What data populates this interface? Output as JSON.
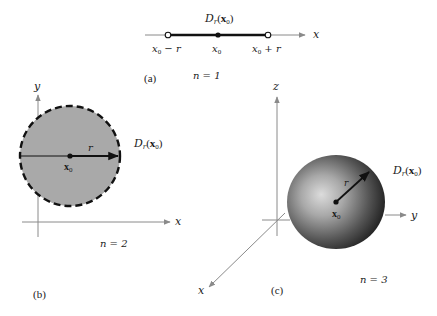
{
  "panel_a": {
    "caption": "(a)",
    "dimension_label": "n = 1",
    "ball_label": {
      "D": "D",
      "sub": "r",
      "paren_open": "(",
      "x": "x",
      "x_sub": "0",
      "paren_close": ")"
    },
    "axis_label": "x",
    "ticks": {
      "left": {
        "x": "x",
        "sub": "0",
        "rest": " − r"
      },
      "center": {
        "x": "x",
        "sub": "0"
      },
      "right": {
        "x": "x",
        "sub": "0",
        "rest": " + r"
      }
    }
  },
  "panel_b": {
    "caption": "(b)",
    "dimension_label": "n = 2",
    "ball_label": {
      "D": "D",
      "sub": "r",
      "paren_open": "(",
      "x": "x",
      "x_sub": "0",
      "paren_close": ")"
    },
    "x_axis_label": "x",
    "y_axis_label": "y",
    "radius_label": "r",
    "center_label": {
      "x": "x",
      "sub": "0"
    }
  },
  "panel_c": {
    "caption": "(c)",
    "dimension_label": "n = 3",
    "ball_label": {
      "D": "D",
      "sub": "r",
      "paren_open": "(",
      "x": "x",
      "x_sub": "0",
      "paren_close": ")"
    },
    "x_axis_label": "x",
    "y_axis_label": "y",
    "z_axis_label": "z",
    "radius_label": "r",
    "center_label": {
      "x": "x",
      "sub": "0"
    }
  },
  "colors": {
    "ink": "#1a1a1a",
    "axis": "#8a8a8a",
    "disk_fill": "#a9a9a9",
    "sphere_light": "#d8d8d8",
    "sphere_dark": "#2a2a2a"
  }
}
